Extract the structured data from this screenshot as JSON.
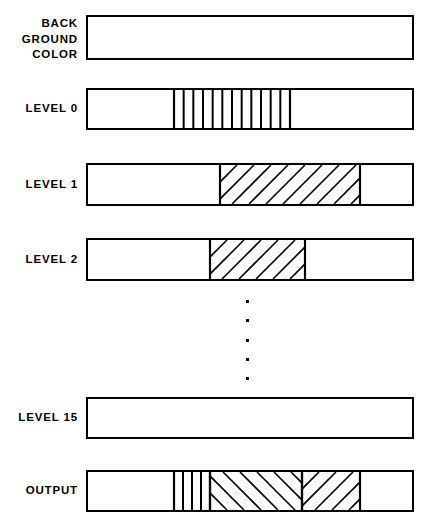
{
  "figure": {
    "width": 428,
    "height": 523,
    "background_color": "#ffffff",
    "line_color": "#000000"
  },
  "bars": {
    "left": 86,
    "right": 414,
    "width": 328,
    "height": 40,
    "border_width": 2
  },
  "rows": [
    {
      "id": "background-color",
      "label": "BACK\nGROUND\nCOLOR",
      "label_lines": [
        "BACK",
        "GROUND",
        "COLOR"
      ],
      "y": 15,
      "height": 45,
      "label_y": 16,
      "fills": []
    },
    {
      "id": "level-0",
      "label": "LEVEL 0",
      "label_lines": [
        "LEVEL 0"
      ],
      "y": 88,
      "height": 42,
      "label_y": 101,
      "fills": [
        {
          "kind": "vertical-stripes",
          "x_start": 172,
          "x_end": 288,
          "stripe_count": 11,
          "stripe_spacing": 10,
          "stroke_width": 2
        }
      ]
    },
    {
      "id": "level-1",
      "label": "LEVEL 1",
      "label_lines": [
        "LEVEL 1"
      ],
      "y": 163,
      "height": 43,
      "label_y": 177,
      "fills": [
        {
          "kind": "diagonal-forward",
          "x_start": 218,
          "x_end": 358,
          "stripe_spacing": 17,
          "stroke_width": 1.6
        }
      ]
    },
    {
      "id": "level-2",
      "label": "LEVEL 2",
      "label_lines": [
        "LEVEL 2"
      ],
      "y": 238,
      "height": 43,
      "label_y": 252,
      "fills": [
        {
          "kind": "diagonal-forward",
          "x_start": 208,
          "x_end": 303,
          "stripe_spacing": 17,
          "stroke_width": 1.6
        }
      ]
    },
    {
      "id": "level-15",
      "label": "LEVEL 15",
      "label_lines": [
        "LEVEL 15"
      ],
      "y": 397,
      "height": 42,
      "label_y": 410,
      "fills": []
    },
    {
      "id": "output",
      "label": "OUTPUT",
      "label_lines": [
        "OUTPUT"
      ],
      "y": 470,
      "height": 42,
      "label_y": 483,
      "fills": [
        {
          "kind": "vertical-stripes",
          "x_start": 172,
          "x_end": 208,
          "stripe_count": 3,
          "stripe_spacing": 9,
          "stroke_width": 2
        },
        {
          "kind": "diagonal-backward",
          "x_start": 208,
          "x_end": 300,
          "stripe_spacing": 17,
          "stroke_width": 1.6
        },
        {
          "kind": "diagonal-forward",
          "x_start": 300,
          "x_end": 358,
          "stripe_spacing": 17,
          "stroke_width": 1.6
        }
      ]
    }
  ],
  "ellipsis": {
    "label": "vertical-ellipsis",
    "center_x": 247,
    "dot_size": 3,
    "dots_y": [
      300,
      319,
      339,
      358,
      377
    ]
  }
}
